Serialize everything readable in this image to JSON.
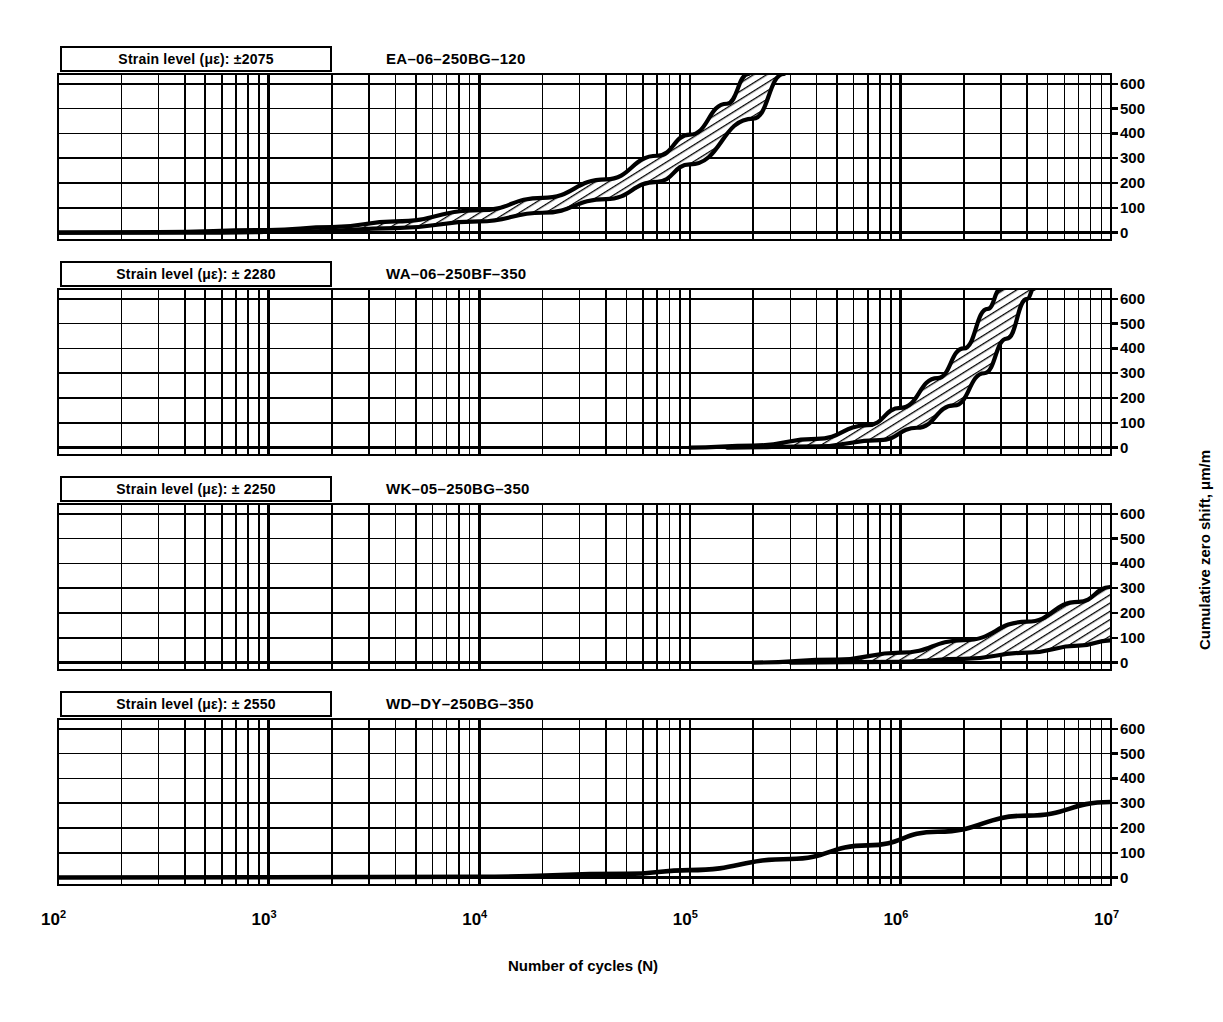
{
  "figure": {
    "axis_titles": {
      "x": "Number of cycles (N)",
      "y": "Cumulative zero shift, μm/m"
    },
    "x_ticks": [
      {
        "base": "10",
        "exp": "2",
        "value": 100
      },
      {
        "base": "10",
        "exp": "3",
        "value": 1000
      },
      {
        "base": "10",
        "exp": "4",
        "value": 10000
      },
      {
        "base": "10",
        "exp": "5",
        "value": 100000
      },
      {
        "base": "10",
        "exp": "6",
        "value": 1000000
      },
      {
        "base": "10",
        "exp": "7",
        "value": 10000000
      }
    ],
    "y_ticks": [
      "600",
      "500",
      "400",
      "300",
      "200",
      "100",
      "0"
    ],
    "colors": {
      "ink": "#000000",
      "grid_major": "#000000",
      "grid_minor": "#000000",
      "background": "#ffffff"
    }
  },
  "panels": [
    {
      "id": "panel-1",
      "strain_label": "Strain level (με): ±2075",
      "gage_title": "EA–06–250BG–120"
    },
    {
      "id": "panel-2",
      "strain_label": "Strain level (με): ± 2280",
      "gage_title": "WA–06–250BF–350"
    },
    {
      "id": "panel-3",
      "strain_label": "Strain level (με): ± 2250",
      "gage_title": "WK–05–250BG–350"
    },
    {
      "id": "panel-4",
      "strain_label": "Strain level (με): ± 2550",
      "gage_title": "WD–DY–250BG–350"
    }
  ],
  "chart_data": {
    "type": "line",
    "title": "",
    "xlabel": "Number of cycles (N)",
    "ylabel": "Cumulative zero shift, μm/m",
    "x_scale": "log",
    "xlim": [
      100,
      10000000
    ],
    "ylim": [
      -30,
      640
    ],
    "y_tick_values": [
      0,
      100,
      200,
      300,
      400,
      500,
      600
    ],
    "grid": "log-minor-and-major",
    "legend": "none",
    "panels": [
      {
        "name": "EA–06–250BG–120",
        "strain_level_microstrain": 2075,
        "band": "hatched",
        "series": [
          {
            "name": "upper bound",
            "points": [
              [
                100,
                0
              ],
              [
                300,
                2
              ],
              [
                1000,
                10
              ],
              [
                2000,
                22
              ],
              [
                4000,
                45
              ],
              [
                10000,
                90
              ],
              [
                20000,
                140
              ],
              [
                40000,
                215
              ],
              [
                70000,
                310
              ],
              [
                100000,
                395
              ],
              [
                150000,
                520
              ],
              [
                190000,
                640
              ]
            ]
          },
          {
            "name": "lower bound",
            "points": [
              [
                100,
                0
              ],
              [
                600,
                0
              ],
              [
                1500,
                5
              ],
              [
                4000,
                18
              ],
              [
                10000,
                45
              ],
              [
                20000,
                80
              ],
              [
                40000,
                135
              ],
              [
                70000,
                205
              ],
              [
                100000,
                275
              ],
              [
                200000,
                460
              ],
              [
                280000,
                640
              ]
            ]
          }
        ]
      },
      {
        "name": "WA–06–250BF–350",
        "strain_level_microstrain": 2280,
        "band": "hatched",
        "series": [
          {
            "name": "upper bound",
            "points": [
              [
                100000,
                0
              ],
              [
                200000,
                8
              ],
              [
                400000,
                35
              ],
              [
                700000,
                90
              ],
              [
                1000000,
                160
              ],
              [
                1500000,
                280
              ],
              [
                2000000,
                400
              ],
              [
                2600000,
                560
              ],
              [
                3000000,
                640
              ]
            ]
          },
          {
            "name": "lower bound",
            "points": [
              [
                150000,
                0
              ],
              [
                400000,
                5
              ],
              [
                800000,
                30
              ],
              [
                1200000,
                80
              ],
              [
                1800000,
                170
              ],
              [
                2500000,
                300
              ],
              [
                3200000,
                440
              ],
              [
                4000000,
                600
              ],
              [
                4300000,
                640
              ]
            ]
          }
        ]
      },
      {
        "name": "WK–05–250BG–350",
        "strain_level_microstrain": 2250,
        "band": "hatched",
        "series": [
          {
            "name": "upper bound",
            "points": [
              [
                200000,
                0
              ],
              [
                500000,
                12
              ],
              [
                1000000,
                40
              ],
              [
                2000000,
                90
              ],
              [
                4000000,
                165
              ],
              [
                7000000,
                245
              ],
              [
                10000000,
                305
              ]
            ]
          },
          {
            "name": "lower bound",
            "points": [
              [
                300000,
                0
              ],
              [
                1000000,
                3
              ],
              [
                2000000,
                15
              ],
              [
                4000000,
                40
              ],
              [
                7000000,
                68
              ],
              [
                10000000,
                90
              ]
            ]
          }
        ]
      },
      {
        "name": "WD–DY–250BG–350",
        "strain_level_microstrain": 2550,
        "band": "single-line",
        "series": [
          {
            "name": "mean",
            "points": [
              [
                100,
                0
              ],
              [
                10000,
                3
              ],
              [
                50000,
                15
              ],
              [
                100000,
                30
              ],
              [
                300000,
                75
              ],
              [
                700000,
                130
              ],
              [
                1500000,
                185
              ],
              [
                4000000,
                250
              ],
              [
                10000000,
                305
              ]
            ]
          }
        ]
      }
    ]
  }
}
